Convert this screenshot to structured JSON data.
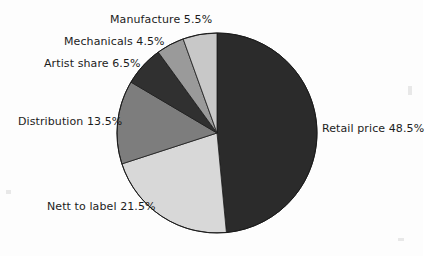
{
  "chart_data": {
    "type": "pie",
    "title": "",
    "subtitle": "",
    "xlabel": "",
    "ylabel": "",
    "legend_position": "none",
    "grid": false,
    "unit": "%",
    "start_angle_deg": 0,
    "direction": "clockwise",
    "categories": [
      "Retail price",
      "Nett to label",
      "Distribution",
      "Artist share",
      "Mechanicals",
      "Manufacture"
    ],
    "values": [
      48.5,
      21.5,
      13.5,
      6.5,
      4.5,
      5.5
    ],
    "slices": [
      {
        "label": "Retail price",
        "value": 48.5,
        "text": "Retail price 48.5%",
        "color": "#2b2b2b",
        "start_deg": 0,
        "end_deg": 174.6
      },
      {
        "label": "Nett to label",
        "value": 21.5,
        "text": "Nett to label 21.5%",
        "color": "#d8d8d8",
        "start_deg": 174.6,
        "end_deg": 252.0
      },
      {
        "label": "Distribution",
        "value": 13.5,
        "text": "Distribution 13.5%",
        "color": "#7d7d7d",
        "start_deg": 252.0,
        "end_deg": 300.6
      },
      {
        "label": "Artist share",
        "value": 6.5,
        "text": "Artist share 6.5%",
        "color": "#303030",
        "start_deg": 300.6,
        "end_deg": 324.0
      },
      {
        "label": "Mechanicals",
        "value": 4.5,
        "text": "Mechanicals 4.5%",
        "color": "#9a9a9a",
        "start_deg": 324.0,
        "end_deg": 340.2
      },
      {
        "label": "Manufacture",
        "value": 5.5,
        "text": "Manufacture 5.5%",
        "color": "#c8c8c8",
        "start_deg": 340.2,
        "end_deg": 360.0
      }
    ],
    "geometry": {
      "center_x": 217,
      "center_y": 133,
      "radius": 100,
      "outline_color": "#1a1a1a",
      "background": "#fdfdfd"
    }
  }
}
